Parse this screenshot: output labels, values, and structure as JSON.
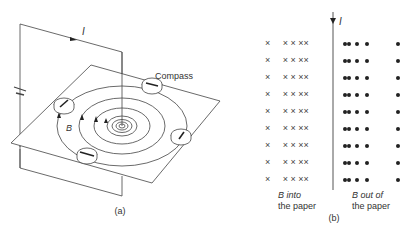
{
  "figure": {
    "panel_a": {
      "caption": "(a)",
      "current_label": "I",
      "field_label": "B",
      "compass_label": "Compass",
      "compass_count": 4,
      "field_circle_count": 7
    },
    "panel_b": {
      "caption": "(b)",
      "current_label": "I",
      "left_label_line1": "B into",
      "left_label_line2": "the paper",
      "right_label_line1": "B out of",
      "right_label_line2": "the paper",
      "rows": 9,
      "cross_symbol": "×",
      "dot_symbol": "●"
    }
  }
}
